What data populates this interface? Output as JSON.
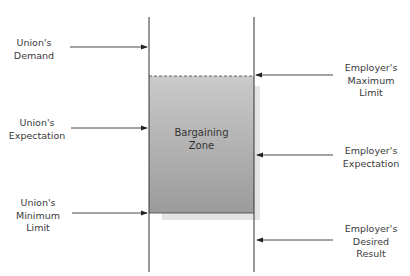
{
  "diagram": {
    "type": "bargaining-zone",
    "zone_label": [
      "Bargaining",
      "Zone"
    ],
    "union_labels": [
      [
        "Union's",
        "Demand"
      ],
      [
        "Union's",
        "Expectation"
      ],
      [
        "Union's",
        "Minimum",
        "Limit"
      ]
    ],
    "employer_labels": [
      [
        "Employer's",
        "Maximum",
        "Limit"
      ],
      [
        "Employer's",
        "Expectation"
      ],
      [
        "Employer's",
        "Desired",
        "Result"
      ]
    ],
    "colors": {
      "zone_fill_top": "#c9c9c9",
      "zone_fill_bottom": "#9d9d9d",
      "line": "#333333"
    }
  }
}
